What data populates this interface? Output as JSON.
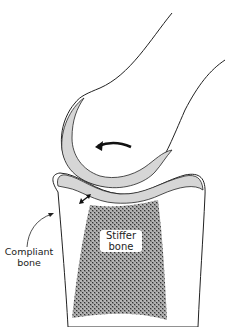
{
  "figure": {
    "type": "anatomical-joint-diagram",
    "labels": {
      "stiffer_bone_line1": "Stiffer",
      "stiffer_bone_line2": "bone",
      "compliant_bone_line1": "Compliant",
      "compliant_bone_line2": "bone"
    },
    "colors": {
      "outline": "#222222",
      "cartilage": "#d6d6d6",
      "stipple": "#555555",
      "background": "#ffffff"
    },
    "annotations": {
      "rotation_arrow": "curved arrow pointing left (rotation)",
      "compression_arrow": "double-headed arrow across cartilage"
    }
  }
}
